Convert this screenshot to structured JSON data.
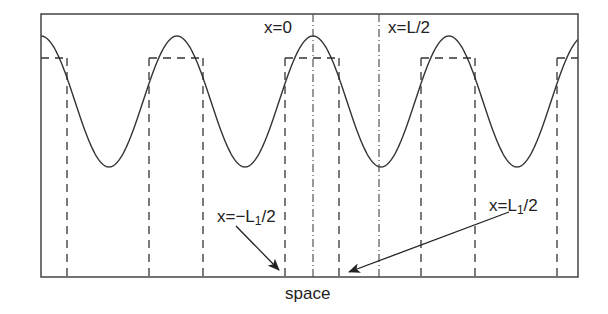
{
  "figure": {
    "xlabel": "space",
    "labels": {
      "x0": "x=0",
      "xhalfL": "x=L/2",
      "neg_l1_pre": "x=−L",
      "neg_l1_sub": "1",
      "neg_l1_post": "/2",
      "pos_l1_pre": "x=L",
      "pos_l1_sub": "1",
      "pos_l1_post": "/2"
    },
    "colors": {
      "line": "#333333",
      "frame": "#444444",
      "background": "#ffffff"
    }
  },
  "geometry": {
    "frame": {
      "x0": 41,
      "y0": 14,
      "x1": 578,
      "y1": 277
    },
    "cosine": {
      "center_x": 313,
      "period": 136,
      "peak_y": 36,
      "trough_y": 167
    },
    "step_top_y": 58,
    "step_edges_x": [
      67,
      149,
      203,
      285,
      339,
      421,
      475,
      557
    ],
    "dashdot_x": [
      313,
      379
    ],
    "arrows": [
      {
        "from": [
          236,
          226
        ],
        "to": [
          279,
          270
        ]
      },
      {
        "from": [
          509,
          212
        ],
        "to": [
          349,
          272
        ]
      }
    ]
  }
}
